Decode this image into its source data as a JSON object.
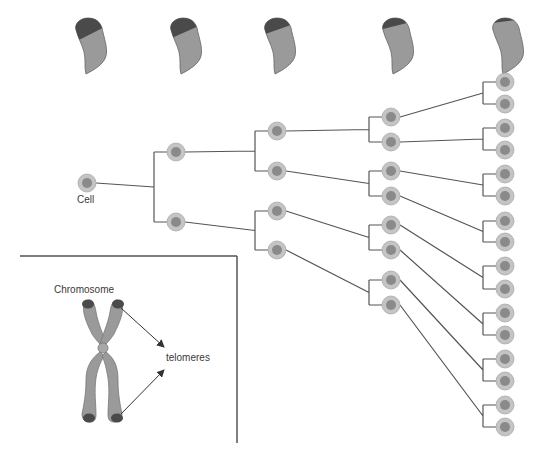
{
  "labels": {
    "cell": "Cell",
    "chromosome": "Chromosome",
    "telomeres": "telomeres"
  },
  "colors": {
    "background": "#ffffff",
    "line": "#555555",
    "cell_outer": "#c4c4c4",
    "cell_inner": "#8a8a8a",
    "chromosome_body": "#9a9a9a",
    "telomere_cap": "#4a4a4a"
  },
  "generations": [
    {
      "x": 87,
      "ys": [
        183
      ]
    },
    {
      "x": 176,
      "ys": [
        152,
        222
      ]
    },
    {
      "x": 277,
      "ys": [
        131,
        171,
        211,
        250
      ]
    },
    {
      "x": 391,
      "ys": [
        117,
        142,
        171,
        196,
        225,
        250,
        280,
        305
      ]
    },
    {
      "x": 505,
      "ys": [
        82,
        104,
        128,
        150,
        174,
        196,
        221,
        242,
        266,
        289,
        313,
        335,
        359,
        381,
        405,
        427
      ]
    }
  ],
  "telomere_shapes": [
    {
      "x": 88,
      "cap_fraction": 0.42
    },
    {
      "x": 183,
      "cap_fraction": 0.36
    },
    {
      "x": 277,
      "cap_fraction": 0.28
    },
    {
      "x": 395,
      "cap_fraction": 0.18
    },
    {
      "x": 505,
      "cap_fraction": 0.06
    }
  ]
}
